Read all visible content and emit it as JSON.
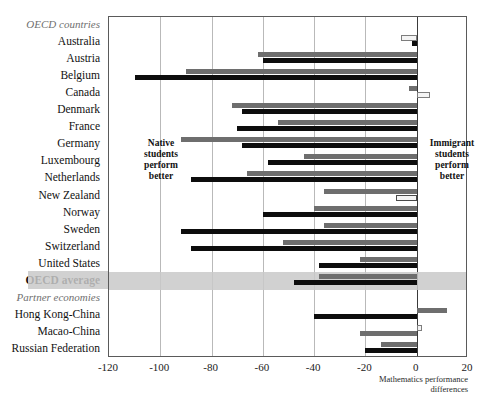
{
  "chart_data": {
    "type": "bar",
    "orientation": "horizontal",
    "title": "",
    "xlabel": "Mathematics performance differences",
    "ylabel": "",
    "xlim": [
      -120,
      20
    ],
    "xticks": [
      -120,
      -100,
      -80,
      -60,
      -40,
      -20,
      0,
      20
    ],
    "xtick_labels": [
      "-120",
      "-100",
      "-80",
      "-60",
      "-40",
      "-20",
      "0",
      "20"
    ],
    "grid": true,
    "legend_position": "none",
    "annotations": [
      "Native students perform better",
      "Immigrant students perform better"
    ],
    "group_headers": [
      "OECD countries",
      "Partner economies"
    ],
    "categories": [
      "Australia",
      "Austria",
      "Belgium",
      "Canada",
      "Denmark",
      "France",
      "Germany",
      "Luxembourg",
      "Netherlands",
      "New Zealand",
      "Norway",
      "Sweden",
      "Switzerland",
      "United States",
      "OECD average",
      "Hong Kong-China",
      "Macao-China",
      "Russian Federation"
    ],
    "series": [
      {
        "name": "native-series",
        "color": "#6e6e6e",
        "values": [
          -6,
          -62,
          -90,
          -3,
          -72,
          -54,
          -92,
          -44,
          -66,
          -36,
          -40,
          -36,
          -52,
          -22,
          -38,
          12,
          2,
          -14
        ]
      },
      {
        "name": "immigrant-series",
        "color": "#0d0d0d",
        "values": [
          -2,
          -60,
          -110,
          5,
          -68,
          -70,
          -68,
          -58,
          -88,
          -8,
          -60,
          -92,
          -88,
          -38,
          -48,
          -40,
          -22,
          -20
        ]
      }
    ]
  },
  "axis": {
    "caption_line1": "Mathematics performance",
    "caption_line2": "differences"
  },
  "annotations": {
    "native": "Native\nstudents\nperform\nbetter",
    "native_l1": "Native",
    "native_l2": "students",
    "native_l3": "perform",
    "native_l4": "better",
    "immigrant_l1": "Immigrant",
    "immigrant_l2": "students",
    "immigrant_l3": "perform",
    "immigrant_l4": "better"
  },
  "rows": [
    {
      "label": "OECD countries",
      "kind": "group",
      "native": null,
      "immigrant": null
    },
    {
      "label": "Australia",
      "kind": "country",
      "native": -6,
      "immigrant": -2,
      "native_style": "light",
      "immigrant_style": "dark"
    },
    {
      "label": "Austria",
      "kind": "country",
      "native": -62,
      "immigrant": -60,
      "native_style": "gray",
      "immigrant_style": "dark"
    },
    {
      "label": "Belgium",
      "kind": "country",
      "native": -90,
      "immigrant": -110,
      "native_style": "gray",
      "immigrant_style": "dark"
    },
    {
      "label": "Canada",
      "kind": "country",
      "native": -3,
      "immigrant": 5,
      "native_style": "gray",
      "immigrant_style": "light"
    },
    {
      "label": "Denmark",
      "kind": "country",
      "native": -72,
      "immigrant": -68,
      "native_style": "gray",
      "immigrant_style": "dark"
    },
    {
      "label": "France",
      "kind": "country",
      "native": -54,
      "immigrant": -70,
      "native_style": "gray",
      "immigrant_style": "dark"
    },
    {
      "label": "Germany",
      "kind": "country",
      "native": -92,
      "immigrant": -68,
      "native_style": "gray",
      "immigrant_style": "dark"
    },
    {
      "label": "Luxembourg",
      "kind": "country",
      "native": -44,
      "immigrant": -58,
      "native_style": "gray",
      "immigrant_style": "dark"
    },
    {
      "label": "Netherlands",
      "kind": "country",
      "native": -66,
      "immigrant": -88,
      "native_style": "gray",
      "immigrant_style": "dark"
    },
    {
      "label": "New Zealand",
      "kind": "country",
      "native": -36,
      "immigrant": -8,
      "native_style": "gray",
      "immigrant_style": "grayb"
    },
    {
      "label": "Norway",
      "kind": "country",
      "native": -40,
      "immigrant": -60,
      "native_style": "gray",
      "immigrant_style": "dark"
    },
    {
      "label": "Sweden",
      "kind": "country",
      "native": -36,
      "immigrant": -92,
      "native_style": "gray",
      "immigrant_style": "dark"
    },
    {
      "label": "Switzerland",
      "kind": "country",
      "native": -52,
      "immigrant": -88,
      "native_style": "gray",
      "immigrant_style": "dark"
    },
    {
      "label": "United States",
      "kind": "country",
      "native": -22,
      "immigrant": -38,
      "native_style": "gray",
      "immigrant_style": "dark"
    },
    {
      "label": "OECD average",
      "kind": "average",
      "native": -38,
      "immigrant": -48,
      "native_style": "gray",
      "immigrant_style": "dark"
    },
    {
      "label": "Partner economies",
      "kind": "group",
      "native": null,
      "immigrant": null
    },
    {
      "label": "Hong Kong-China",
      "kind": "country",
      "native": 12,
      "immigrant": -40,
      "native_style": "gray",
      "immigrant_style": "dark"
    },
    {
      "label": "Macao-China",
      "kind": "country",
      "native": 2,
      "immigrant": -22,
      "native_style": "light",
      "immigrant_style": "gray2"
    },
    {
      "label": "Russian Federation",
      "kind": "country",
      "native": -14,
      "immigrant": -20,
      "native_style": "gray",
      "immigrant_style": "dark"
    }
  ]
}
